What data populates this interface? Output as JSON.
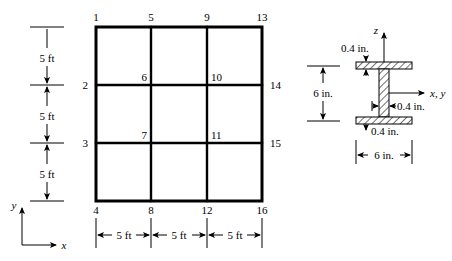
{
  "figure": {
    "stroke_color": "#000000",
    "background_color": "#ffffff"
  },
  "frame": {
    "name": "four-by-four-node-grid",
    "columns": 3,
    "rows": 3,
    "nodes": [
      {
        "id": "1",
        "label": "1",
        "x": 96,
        "y": 27,
        "anchor": "above-left"
      },
      {
        "id": "2",
        "label": "2",
        "x": 96,
        "y": 85,
        "anchor": "left"
      },
      {
        "id": "3",
        "label": "3",
        "x": 96,
        "y": 143,
        "anchor": "left"
      },
      {
        "id": "4",
        "label": "4",
        "x": 96,
        "y": 201,
        "anchor": "below-left"
      },
      {
        "id": "5",
        "label": "5",
        "x": 151,
        "y": 27,
        "anchor": "above"
      },
      {
        "id": "6",
        "label": "6",
        "x": 151,
        "y": 85,
        "anchor": "above-left"
      },
      {
        "id": "7",
        "label": "7",
        "x": 151,
        "y": 143,
        "anchor": "above-left"
      },
      {
        "id": "8",
        "label": "8",
        "x": 151,
        "y": 201,
        "anchor": "below"
      },
      {
        "id": "9",
        "label": "9",
        "x": 207,
        "y": 27,
        "anchor": "above"
      },
      {
        "id": "10",
        "label": "10",
        "x": 207,
        "y": 85,
        "anchor": "above-right"
      },
      {
        "id": "11",
        "label": "11",
        "x": 207,
        "y": 143,
        "anchor": "above-right"
      },
      {
        "id": "12",
        "label": "12",
        "x": 207,
        "y": 201,
        "anchor": "below"
      },
      {
        "id": "13",
        "label": "13",
        "x": 262,
        "y": 27,
        "anchor": "above-right"
      },
      {
        "id": "14",
        "label": "14",
        "x": 262,
        "y": 85,
        "anchor": "right"
      },
      {
        "id": "15",
        "label": "15",
        "x": 262,
        "y": 143,
        "anchor": "right"
      },
      {
        "id": "16",
        "label": "16",
        "x": 262,
        "y": 201,
        "anchor": "below-right"
      }
    ],
    "vertical_dimensions": [
      {
        "label": "5 ft"
      },
      {
        "label": "5 ft"
      },
      {
        "label": "5 ft"
      }
    ],
    "horizontal_dimensions": [
      {
        "label": "5 ft"
      },
      {
        "label": "5 ft"
      },
      {
        "label": "5 ft"
      }
    ],
    "global_axes": {
      "x_label": "x",
      "y_label": "y"
    }
  },
  "section": {
    "name": "wide-flange-cross-section",
    "axes": {
      "z_label": "z",
      "xy_label": "x,  y"
    },
    "dimensions": {
      "top_flange_thickness": "0.4 in.",
      "web_thickness": "0.4 in.",
      "bottom_flange_thickness": "0.4 in.",
      "depth": "6 in.",
      "width": "6 in."
    }
  }
}
